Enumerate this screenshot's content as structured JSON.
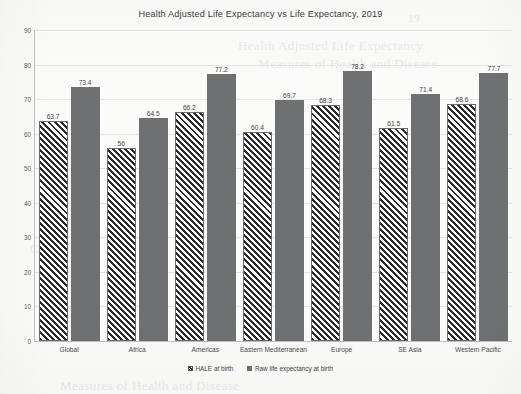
{
  "chart_data": {
    "type": "bar",
    "title": "Health Adjusted Life Expectancy vs Life Expectancy, 2019",
    "xlabel": "",
    "ylabel": "",
    "ylim": [
      0,
      90
    ],
    "yticks": [
      90,
      80,
      70,
      60,
      50,
      40,
      30,
      20,
      10,
      0
    ],
    "grid": true,
    "legend_position": "bottom",
    "categories": [
      "Global",
      "Africa",
      "Americas",
      "Eastern Mediterranean",
      "Europe",
      "SE Asia",
      "Western Pacific"
    ],
    "series": [
      {
        "name": "HALE at birth",
        "color": "#2b2b2b",
        "pattern": "diagonal-hatch",
        "values": [
          63.7,
          56,
          66.2,
          60.4,
          68.3,
          61.5,
          68.6
        ],
        "labels": [
          "63.7",
          "56",
          "66.2",
          "60.4",
          "68.3",
          "61.5",
          "68.6"
        ]
      },
      {
        "name": "Raw life expectancy at birth",
        "color": "#6f7072",
        "pattern": "solid",
        "values": [
          73.4,
          64.5,
          77.2,
          69.7,
          78.2,
          71.4,
          77.7
        ],
        "labels": [
          "73.4",
          "64.5",
          "77.2",
          "69.7",
          "78.2",
          "71.4",
          "77.7"
        ]
      }
    ]
  },
  "page": {
    "bleed_text": [
      "Health Adjusted Life Expectancy",
      "Measures of Health and Disease",
      "Chapter 4",
      "19"
    ]
  }
}
